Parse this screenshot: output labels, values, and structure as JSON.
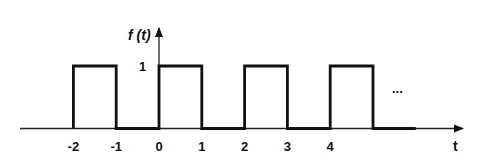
{
  "chart_data": {
    "type": "line",
    "title": "",
    "xlabel": "t",
    "ylabel": "f (t)",
    "x_ticks": [
      "-2",
      "-1",
      "0",
      "1",
      "2",
      "3",
      "4"
    ],
    "y_ticks": [
      "1"
    ],
    "continuation_marker": "...",
    "x": [
      -2,
      -2,
      -1,
      -1,
      0,
      0,
      1,
      1,
      2,
      2,
      3,
      3,
      4,
      4,
      5,
      5,
      6
    ],
    "y": [
      0,
      1,
      1,
      0,
      0,
      1,
      1,
      0,
      0,
      1,
      1,
      0,
      0,
      1,
      1,
      0,
      0
    ],
    "xlim": [
      -3.2,
      7.1
    ],
    "ylim": [
      0,
      1.5
    ],
    "grid": false,
    "colors": {
      "signal": "#111111",
      "axis": "#222222",
      "background": "#ffffff"
    }
  },
  "labels": {
    "y_axis": "f (t)",
    "x_axis": "t",
    "amplitude": "1",
    "ellipsis": "...",
    "ticks": [
      "-2",
      "-1",
      "0",
      "1",
      "2",
      "3",
      "4"
    ]
  }
}
